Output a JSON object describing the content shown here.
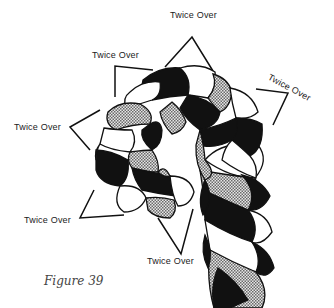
{
  "figure": {
    "caption": "Figure 39",
    "labels": [
      {
        "id": "top",
        "text": "Twice Over",
        "x": 170,
        "y": 16,
        "rotate": 0
      },
      {
        "id": "upper-left",
        "text": "Twice Over",
        "x": 92,
        "y": 50,
        "rotate": 0
      },
      {
        "id": "right",
        "text": "Twice Over",
        "x": 271,
        "y": 74,
        "rotate": 28
      },
      {
        "id": "left",
        "text": "Twice Over",
        "x": 14,
        "y": 122,
        "rotate": 0
      },
      {
        "id": "bottom-left",
        "text": "Twice Over",
        "x": 24,
        "y": 216,
        "rotate": 0
      },
      {
        "id": "bottom",
        "text": "Twice Over",
        "x": 147,
        "y": 257,
        "rotate": 0
      }
    ],
    "strand_fills": [
      "black",
      "white",
      "checkered-grey"
    ]
  }
}
